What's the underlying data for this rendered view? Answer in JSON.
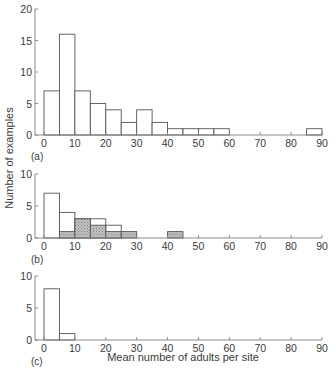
{
  "chart_data": {
    "type": "bar",
    "ylabel": "Number of examples",
    "xlabel": "Mean number of adults per site",
    "bin_width": 5,
    "xlim": [
      0,
      90
    ],
    "x_ticks": [
      0,
      10,
      20,
      30,
      40,
      50,
      60,
      70,
      80,
      90
    ],
    "colors": {
      "axis": "#808080",
      "bar_edge": "#555555",
      "open_fill": "#ffffff",
      "shaded_fill": "#b3b3b3"
    },
    "panels": [
      {
        "tag": "(a)",
        "ylim": [
          0,
          20
        ],
        "y_ticks": [
          0,
          5,
          10,
          15,
          20
        ],
        "series": [
          {
            "name": "open",
            "bins": [
              [
                0,
                5
              ],
              [
                5,
                10
              ],
              [
                10,
                15
              ],
              [
                15,
                20
              ],
              [
                20,
                25
              ],
              [
                25,
                30
              ],
              [
                30,
                35
              ],
              [
                35,
                40
              ],
              [
                40,
                45
              ],
              [
                45,
                50
              ],
              [
                50,
                55
              ],
              [
                55,
                60
              ],
              [
                85,
                90
              ]
            ],
            "values": [
              7,
              16,
              7,
              5,
              4,
              2,
              4,
              2,
              1,
              1,
              1,
              1,
              1
            ]
          }
        ]
      },
      {
        "tag": "(b)",
        "ylim": [
          0,
          10
        ],
        "y_ticks": [
          0,
          5,
          10
        ],
        "series": [
          {
            "name": "open",
            "bins": [
              [
                0,
                5
              ],
              [
                5,
                10
              ],
              [
                10,
                15
              ],
              [
                15,
                20
              ],
              [
                20,
                25
              ]
            ],
            "values": [
              7,
              4,
              3,
              3,
              2
            ]
          },
          {
            "name": "shaded",
            "bins": [
              [
                5,
                10
              ],
              [
                10,
                15
              ],
              [
                15,
                20
              ],
              [
                20,
                25
              ],
              [
                25,
                30
              ],
              [
                40,
                45
              ]
            ],
            "values": [
              1,
              3,
              2,
              1,
              1,
              1
            ]
          }
        ]
      },
      {
        "tag": "(c)",
        "ylim": [
          0,
          10
        ],
        "y_ticks": [
          0,
          5,
          10
        ],
        "series": [
          {
            "name": "open",
            "bins": [
              [
                0,
                5
              ],
              [
                5,
                10
              ]
            ],
            "values": [
              8,
              1
            ]
          }
        ]
      }
    ]
  }
}
